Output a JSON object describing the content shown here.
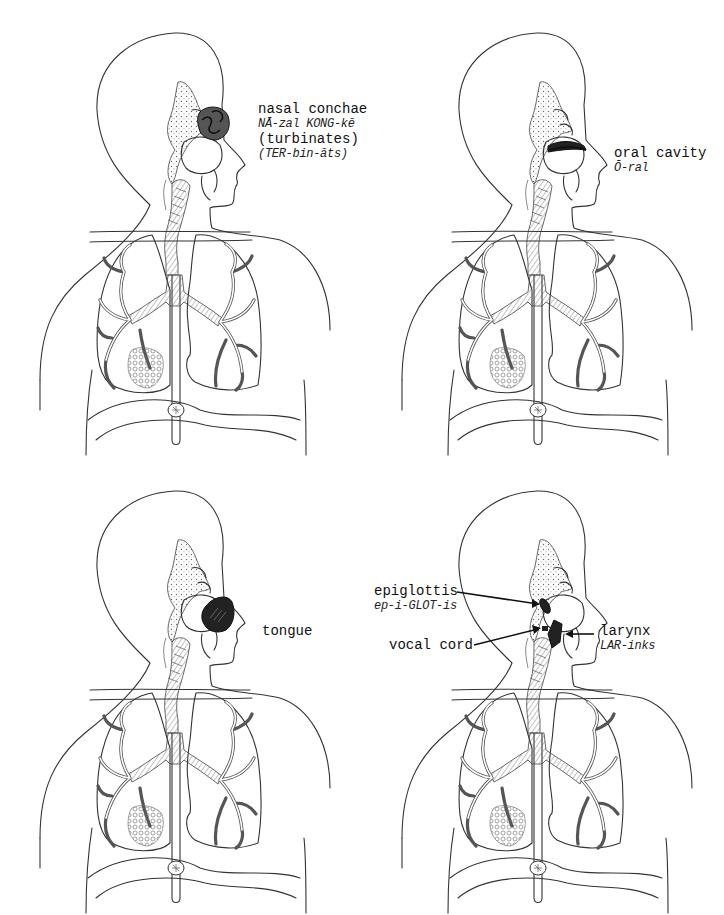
{
  "figure": {
    "panels": [
      {
        "id": "panel-nasal-conchae",
        "highlight": "nasal-conchae",
        "labels": [
          {
            "term": "nasal conchae",
            "pronunciation": "NĀ-zal KONG-kē"
          },
          {
            "term": "(turbinates)",
            "pronunciation": "(TER-bin-āts)"
          }
        ]
      },
      {
        "id": "panel-oral-cavity",
        "highlight": "oral-cavity",
        "labels": [
          {
            "term": "oral cavity",
            "pronunciation": "Ō-ral"
          }
        ]
      },
      {
        "id": "panel-tongue",
        "highlight": "tongue",
        "labels": [
          {
            "term": "tongue"
          }
        ]
      },
      {
        "id": "panel-larynx",
        "highlight": "larynx",
        "labels": [
          {
            "term": "epiglottis",
            "pronunciation": "ep-i-GLOT-is"
          },
          {
            "term": "vocal cord"
          },
          {
            "term": "larynx",
            "pronunciation": "LAR-inks"
          }
        ]
      }
    ]
  }
}
